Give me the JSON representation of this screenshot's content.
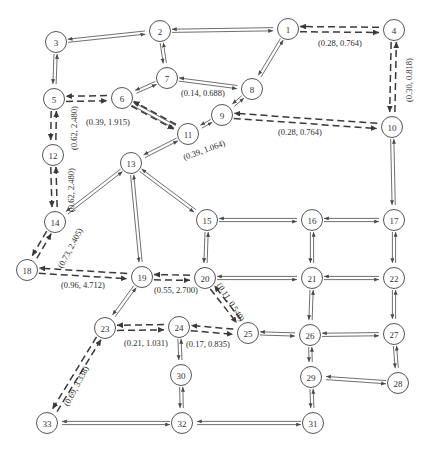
{
  "figure": {
    "type": "directed-network-graph",
    "node_count": 33,
    "width": 426,
    "height": 450,
    "node_fill": "#ffffff",
    "node_stroke": "#555555",
    "solid_edge_color": "#4a4a4a",
    "dashed_edge_color": "#3a3a3a"
  },
  "nodes": [
    {
      "id": "1",
      "label": "1",
      "x": 288,
      "y": 29
    },
    {
      "id": "2",
      "label": "2",
      "x": 160,
      "y": 31
    },
    {
      "id": "3",
      "label": "3",
      "x": 56,
      "y": 42
    },
    {
      "id": "4",
      "label": "4",
      "x": 394,
      "y": 30
    },
    {
      "id": "5",
      "label": "5",
      "x": 54,
      "y": 99
    },
    {
      "id": "6",
      "label": "6",
      "x": 122,
      "y": 98
    },
    {
      "id": "7",
      "label": "7",
      "x": 167,
      "y": 78
    },
    {
      "id": "8",
      "label": "8",
      "x": 252,
      "y": 89
    },
    {
      "id": "9",
      "label": "9",
      "x": 222,
      "y": 115
    },
    {
      "id": "10",
      "label": "10",
      "x": 392,
      "y": 127
    },
    {
      "id": "11",
      "label": "11",
      "x": 188,
      "y": 134
    },
    {
      "id": "12",
      "label": "12",
      "x": 53,
      "y": 155
    },
    {
      "id": "13",
      "label": "13",
      "x": 131,
      "y": 163
    },
    {
      "id": "14",
      "label": "14",
      "x": 55,
      "y": 222
    },
    {
      "id": "15",
      "label": "15",
      "x": 207,
      "y": 220
    },
    {
      "id": "16",
      "label": "16",
      "x": 312,
      "y": 220
    },
    {
      "id": "17",
      "label": "17",
      "x": 394,
      "y": 220
    },
    {
      "id": "18",
      "label": "18",
      "x": 27,
      "y": 270
    },
    {
      "id": "19",
      "label": "19",
      "x": 142,
      "y": 277
    },
    {
      "id": "20",
      "label": "20",
      "x": 205,
      "y": 278
    },
    {
      "id": "21",
      "label": "21",
      "x": 312,
      "y": 278
    },
    {
      "id": "22",
      "label": "22",
      "x": 394,
      "y": 278
    },
    {
      "id": "23",
      "label": "23",
      "x": 105,
      "y": 328
    },
    {
      "id": "24",
      "label": "24",
      "x": 179,
      "y": 327
    },
    {
      "id": "25",
      "label": "25",
      "x": 248,
      "y": 333
    },
    {
      "id": "26",
      "label": "26",
      "x": 310,
      "y": 335
    },
    {
      "id": "27",
      "label": "27",
      "x": 394,
      "y": 334
    },
    {
      "id": "28",
      "label": "28",
      "x": 398,
      "y": 383
    },
    {
      "id": "29",
      "label": "29",
      "x": 311,
      "y": 377
    },
    {
      "id": "30",
      "label": "30",
      "x": 181,
      "y": 375
    },
    {
      "id": "31",
      "label": "31",
      "x": 313,
      "y": 423
    },
    {
      "id": "32",
      "label": "32",
      "x": 182,
      "y": 423
    },
    {
      "id": "33",
      "label": "33",
      "x": 47,
      "y": 423
    }
  ],
  "edge_labels": [
    {
      "id": "lbl-1-4",
      "text": "(0.28, 0.764)",
      "x": 340,
      "y": 43,
      "rotation": 0
    },
    {
      "id": "lbl-4-10",
      "text": "(0.30, 0.818)",
      "x": 409,
      "y": 80,
      "rotation": -90
    },
    {
      "id": "lbl-7-8",
      "text": "(0.14, 0.688)",
      "x": 203,
      "y": 93,
      "rotation": 0
    },
    {
      "id": "lbl-5-6",
      "text": "(0.39, 1.915)",
      "x": 108,
      "y": 122,
      "rotation": 0
    },
    {
      "id": "lbl-9-10",
      "text": "(0.28, 0.764)",
      "x": 300,
      "y": 132,
      "rotation": 0
    },
    {
      "id": "lbl-11-9",
      "text": "(0.39, 1.064)",
      "x": 204,
      "y": 150,
      "rotation": -20
    },
    {
      "id": "lbl-5-12",
      "text": "(0.62, 2.480)",
      "x": 74,
      "y": 128,
      "rotation": -90
    },
    {
      "id": "lbl-12-14",
      "text": "(0.62, 2.480)",
      "x": 71,
      "y": 190,
      "rotation": -90
    },
    {
      "id": "lbl-14-18",
      "text": "(0.73, 2.405)",
      "x": 70,
      "y": 248,
      "rotation": -62
    },
    {
      "id": "lbl-18-19",
      "text": "(0.96, 4.712)",
      "x": 83,
      "y": 285,
      "rotation": 0
    },
    {
      "id": "lbl-19-20",
      "text": "(0.55, 2.700)",
      "x": 176,
      "y": 290,
      "rotation": 0
    },
    {
      "id": "lbl-20-25",
      "text": "(0.11, 0.540)",
      "x": 231,
      "y": 302,
      "rotation": 57
    },
    {
      "id": "lbl-23-24",
      "text": "(0.21, 1.031)",
      "x": 146,
      "y": 343,
      "rotation": 0
    },
    {
      "id": "lbl-24-25",
      "text": "(0.17, 0.835)",
      "x": 208,
      "y": 344,
      "rotation": 0
    },
    {
      "id": "lbl-23-33",
      "text": "(0.69, 3.338)",
      "x": 76,
      "y": 386,
      "rotation": -62
    }
  ],
  "edges_solid": [
    {
      "from": "3",
      "to": "2"
    },
    {
      "from": "2",
      "to": "1"
    },
    {
      "from": "3",
      "to": "5"
    },
    {
      "from": "2",
      "to": "7"
    },
    {
      "from": "7",
      "to": "6"
    },
    {
      "from": "7",
      "to": "8"
    },
    {
      "from": "1",
      "to": "8"
    },
    {
      "from": "8",
      "to": "9"
    },
    {
      "from": "9",
      "to": "11"
    },
    {
      "from": "6",
      "to": "11"
    },
    {
      "from": "11",
      "to": "13"
    },
    {
      "from": "13",
      "to": "15"
    },
    {
      "from": "13",
      "to": "14"
    },
    {
      "from": "13",
      "to": "19"
    },
    {
      "from": "15",
      "to": "20"
    },
    {
      "from": "15",
      "to": "16"
    },
    {
      "from": "16",
      "to": "17"
    },
    {
      "from": "16",
      "to": "21"
    },
    {
      "from": "17",
      "to": "22"
    },
    {
      "from": "10",
      "to": "17"
    },
    {
      "from": "20",
      "to": "21"
    },
    {
      "from": "21",
      "to": "22"
    },
    {
      "from": "21",
      "to": "26"
    },
    {
      "from": "22",
      "to": "27"
    },
    {
      "from": "19",
      "to": "23"
    },
    {
      "from": "24",
      "to": "30"
    },
    {
      "from": "25",
      "to": "26"
    },
    {
      "from": "26",
      "to": "27"
    },
    {
      "from": "26",
      "to": "29"
    },
    {
      "from": "27",
      "to": "28"
    },
    {
      "from": "28",
      "to": "29"
    },
    {
      "from": "29",
      "to": "31"
    },
    {
      "from": "30",
      "to": "32"
    },
    {
      "from": "31",
      "to": "32"
    },
    {
      "from": "32",
      "to": "33"
    }
  ],
  "edges_dashed": [
    {
      "from": "1",
      "to": "4"
    },
    {
      "from": "4",
      "to": "10"
    },
    {
      "from": "5",
      "to": "6"
    },
    {
      "from": "6",
      "to": "11"
    },
    {
      "from": "9",
      "to": "10"
    },
    {
      "from": "5",
      "to": "12"
    },
    {
      "from": "12",
      "to": "14"
    },
    {
      "from": "14",
      "to": "18"
    },
    {
      "from": "18",
      "to": "19"
    },
    {
      "from": "19",
      "to": "20"
    },
    {
      "from": "20",
      "to": "25"
    },
    {
      "from": "23",
      "to": "24"
    },
    {
      "from": "24",
      "to": "25"
    },
    {
      "from": "23",
      "to": "33"
    }
  ]
}
